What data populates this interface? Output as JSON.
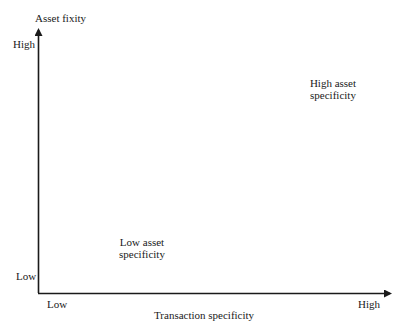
{
  "diagram": {
    "y_axis": {
      "title": "Asset fixity",
      "high_label": "High",
      "low_label": "Low"
    },
    "x_axis": {
      "title": "Transaction specificity",
      "low_label": "Low",
      "high_label": "High"
    },
    "quadrants": {
      "top_right": {
        "line1": "High asset",
        "line2": "specificity"
      },
      "bottom_left": {
        "line1": "Low asset",
        "line2": "specificity"
      }
    },
    "colors": {
      "axis": "#1a1a1a",
      "text": "#1a1a1a",
      "background": "#ffffff"
    }
  }
}
